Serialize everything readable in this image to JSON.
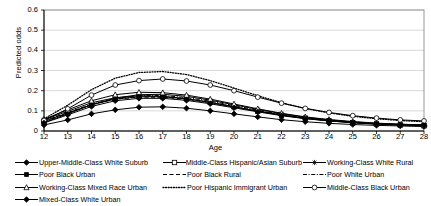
{
  "chart_data": {
    "type": "line",
    "title": "",
    "xlabel": "Age",
    "ylabel": "Predicted odds",
    "xlim": [
      12,
      28
    ],
    "ylim": [
      0,
      0.6
    ],
    "grid": true,
    "legend_position": "bottom",
    "x": [
      12,
      13,
      14,
      15,
      16,
      17,
      18,
      19,
      20,
      21,
      22,
      23,
      24,
      25,
      26,
      27,
      28
    ],
    "xticks": [
      "12",
      "13",
      "14",
      "15",
      "16",
      "17",
      "18",
      "19",
      "20",
      "21",
      "22",
      "23",
      "24",
      "25",
      "26",
      "27",
      "28"
    ],
    "yticks": [
      "0",
      "0.1",
      "0.2",
      "0.3",
      "0.4",
      "0.5",
      "0.6"
    ],
    "series": [
      {
        "name": "Upper-Middle-Class White Suburb",
        "marker": "diamond",
        "line": "solid",
        "color": "#000000",
        "values": [
          0.03,
          0.055,
          0.085,
          0.105,
          0.118,
          0.12,
          0.113,
          0.1,
          0.085,
          0.07,
          0.056,
          0.046,
          0.038,
          0.032,
          0.028,
          0.025,
          0.022
        ]
      },
      {
        "name": "Middle-Class Hispanic/Asian Suburb",
        "marker": "square",
        "line": "solid",
        "color": "#000000",
        "values": [
          0.048,
          0.09,
          0.13,
          0.158,
          0.17,
          0.17,
          0.16,
          0.142,
          0.12,
          0.098,
          0.078,
          0.062,
          0.05,
          0.041,
          0.034,
          0.029,
          0.026
        ]
      },
      {
        "name": "Working-Class White Rural",
        "marker": "star",
        "line": "solid",
        "color": "#000000",
        "values": [
          0.042,
          0.085,
          0.13,
          0.163,
          0.18,
          0.182,
          0.172,
          0.153,
          0.13,
          0.107,
          0.086,
          0.068,
          0.055,
          0.045,
          0.038,
          0.033,
          0.03
        ]
      },
      {
        "name": "Poor Black Urban",
        "marker": "square-small",
        "line": "solid",
        "color": "#000000",
        "values": [
          0.055,
          0.098,
          0.14,
          0.165,
          0.175,
          0.172,
          0.16,
          0.142,
          0.12,
          0.099,
          0.08,
          0.064,
          0.052,
          0.043,
          0.036,
          0.031,
          0.028
        ]
      },
      {
        "name": "Poor Black Rural",
        "marker": "none",
        "line": "dashed",
        "color": "#000000",
        "values": [
          0.05,
          0.092,
          0.132,
          0.158,
          0.168,
          0.167,
          0.157,
          0.14,
          0.119,
          0.098,
          0.079,
          0.063,
          0.051,
          0.042,
          0.035,
          0.031,
          0.028
        ]
      },
      {
        "name": "Poor White Urban",
        "marker": "none",
        "line": "dash-dot",
        "color": "#000000",
        "values": [
          0.045,
          0.088,
          0.132,
          0.162,
          0.175,
          0.176,
          0.166,
          0.148,
          0.126,
          0.103,
          0.083,
          0.066,
          0.054,
          0.044,
          0.037,
          0.032,
          0.029
        ]
      },
      {
        "name": "Working-Class Mixed Race Urban",
        "marker": "triangle",
        "line": "solid",
        "color": "#000000",
        "values": [
          0.058,
          0.105,
          0.15,
          0.18,
          0.192,
          0.19,
          0.178,
          0.158,
          0.134,
          0.11,
          0.088,
          0.07,
          0.057,
          0.047,
          0.039,
          0.034,
          0.03
        ]
      },
      {
        "name": "Poor Hispanic Immigrant Urban",
        "marker": "none",
        "line": "dotted",
        "color": "#000000",
        "values": [
          0.06,
          0.128,
          0.205,
          0.262,
          0.29,
          0.295,
          0.28,
          0.25,
          0.213,
          0.175,
          0.14,
          0.112,
          0.09,
          0.073,
          0.061,
          0.052,
          0.046
        ]
      },
      {
        "name": "Middle-Class Black Urban",
        "marker": "circle",
        "line": "solid",
        "color": "#000000",
        "values": [
          0.052,
          0.11,
          0.178,
          0.228,
          0.25,
          0.258,
          0.248,
          0.228,
          0.2,
          0.168,
          0.138,
          0.112,
          0.092,
          0.076,
          0.064,
          0.055,
          0.05
        ]
      },
      {
        "name": "Mixed-Class White Urban",
        "marker": "diamond",
        "line": "solid",
        "color": "#000000",
        "values": [
          0.04,
          0.08,
          0.122,
          0.15,
          0.162,
          0.162,
          0.152,
          0.135,
          0.115,
          0.095,
          0.076,
          0.061,
          0.05,
          0.041,
          0.035,
          0.03,
          0.027
        ]
      }
    ]
  },
  "legend": {
    "columns": [
      [
        {
          "label": "Upper-Middle-Class White Suburb",
          "key": "solid-diamond"
        },
        {
          "label": "Poor Black Urban",
          "key": "solid-square-small"
        },
        {
          "label": "Working-Class Mixed Race Urban",
          "key": "solid-triangle"
        },
        {
          "label": "Mixed-Class White Urban",
          "key": "solid-diamond"
        }
      ],
      [
        {
          "label": "Middle-Class Hispanic/Asian Suburb",
          "key": "solid-square"
        },
        {
          "label": "Poor Black Rural",
          "key": "dashed"
        },
        {
          "label": "Poor Hispanic Immigrant Urban",
          "key": "dotted"
        }
      ],
      [
        {
          "label": "Working-Class White Rural",
          "key": "solid-star"
        },
        {
          "label": "Poor White Urban",
          "key": "dash-dot"
        },
        {
          "label": "Middle-Class Black Urban",
          "key": "solid-circle"
        }
      ]
    ]
  }
}
